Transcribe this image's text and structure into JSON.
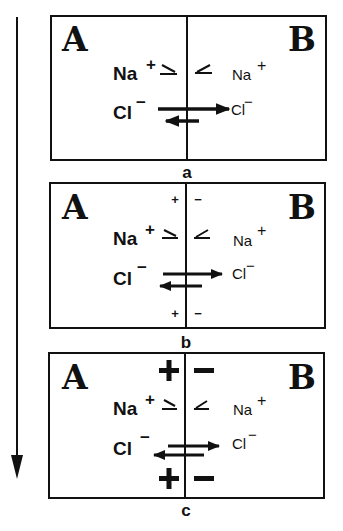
{
  "figure": {
    "time_arrow": {
      "direction": "down",
      "icon": "arrow-down-icon"
    },
    "panels": [
      {
        "id": "a",
        "label": "a",
        "left_compartment": "A",
        "right_compartment": "B",
        "membrane_charge": {
          "left": "",
          "right": ""
        },
        "na": {
          "left": "Na",
          "left_charge": "+",
          "right": "Na",
          "right_charge": "+",
          "flux": "equal, small"
        },
        "cl": {
          "left": "Cl",
          "left_charge": "−",
          "right": "Cl",
          "right_charge": "−",
          "flux": "large A→B, small B→A"
        }
      },
      {
        "id": "b",
        "label": "b",
        "left_compartment": "A",
        "right_compartment": "B",
        "membrane_charge": {
          "left": "+",
          "right": "-"
        },
        "na": {
          "left": "Na",
          "left_charge": "+",
          "right": "Na",
          "right_charge": "+",
          "flux": "equal, small"
        },
        "cl": {
          "left": "Cl",
          "left_charge": "−",
          "right": "Cl",
          "right_charge": "−",
          "flux": "A→B reduced, B→A increased"
        }
      },
      {
        "id": "c",
        "label": "c",
        "left_compartment": "A",
        "right_compartment": "B",
        "membrane_charge": {
          "left": "+",
          "right": "−"
        },
        "na": {
          "left": "Na",
          "left_charge": "+",
          "right": "Na",
          "right_charge": "+",
          "flux": "equal, small"
        },
        "cl": {
          "left": "Cl",
          "left_charge": "−",
          "right": "Cl",
          "right_charge": "−",
          "flux": "A→B ≈ B→A (equilibrium)"
        }
      }
    ]
  }
}
